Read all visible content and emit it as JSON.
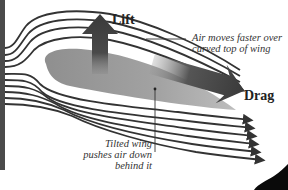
{
  "diagram": {
    "labels": {
      "lift": "Lift",
      "drag": "Drag",
      "top_note_line1": "Air moves faster over",
      "top_note_line2": "curved top of wing",
      "bottom_note_line1": "Tilted wing",
      "bottom_note_line2": "pushes air down",
      "bottom_note_line3": "behind it"
    },
    "elements": {
      "wing": "airfoil",
      "lift_arrow": "up-arrow",
      "drag_arrow": "right-arrow",
      "airflow_lines": 11
    },
    "colors": {
      "airflow": "#333333",
      "wing": "#9a9a9a",
      "arrows": "#3c3c3c",
      "left_bar": "#4a4a4a",
      "background": "#ffffff"
    }
  }
}
